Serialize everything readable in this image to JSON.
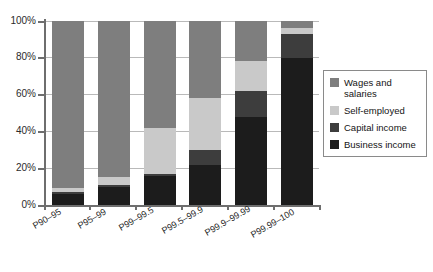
{
  "chart_data": {
    "type": "bar",
    "subtype": "stacked-100-percent",
    "title": "",
    "xlabel": "",
    "ylabel": "",
    "ylim": [
      0,
      100
    ],
    "ytick_labels": [
      "0%",
      "20%",
      "40%",
      "60%",
      "80%",
      "100%"
    ],
    "ytick_values": [
      0,
      20,
      40,
      60,
      80,
      100
    ],
    "grid": true,
    "legend_position": "right",
    "categories": [
      "P90–95",
      "P95–99",
      "P99–99.5",
      "P99.5–99.9",
      "P99.9–99.99",
      "P99.99–100"
    ],
    "series": [
      {
        "name": "Business income",
        "color": "#1c1c1c",
        "values": [
          6,
          10,
          16,
          22,
          48,
          80
        ]
      },
      {
        "name": "Capital income",
        "color": "#3d3d3d",
        "values": [
          1,
          1,
          1,
          8,
          14,
          13
        ]
      },
      {
        "name": "Self-employed",
        "color": "#c9c9c9",
        "values": [
          2,
          4,
          25,
          28,
          16,
          3
        ]
      },
      {
        "name": "Wages and salaries",
        "color": "#7e7e7e",
        "values": [
          91,
          85,
          58,
          42,
          22,
          4
        ]
      }
    ]
  },
  "legend": {
    "items": [
      {
        "label": "Wages and salaries",
        "color": "#7e7e7e",
        "key": "wages-and-salaries"
      },
      {
        "label": "Self-employed",
        "color": "#c9c9c9",
        "key": "self-employed"
      },
      {
        "label": "Capital income",
        "color": "#3d3d3d",
        "key": "capital-income"
      },
      {
        "label": "Business income",
        "color": "#1c1c1c",
        "key": "business-income"
      }
    ]
  },
  "axes": {
    "y": {
      "ticks": [
        {
          "label": "100%",
          "value": 100
        },
        {
          "label": "80%",
          "value": 80
        },
        {
          "label": "60%",
          "value": 60
        },
        {
          "label": "40%",
          "value": 40
        },
        {
          "label": "20%",
          "value": 20
        },
        {
          "label": "0%",
          "value": 0
        }
      ]
    },
    "x": {
      "ticks": [
        {
          "label": "P90–95"
        },
        {
          "label": "P95–99"
        },
        {
          "label": "P99–99.5"
        },
        {
          "label": "P99.5–99.9"
        },
        {
          "label": "P99.9–99.99"
        },
        {
          "label": "P99.99–100"
        }
      ]
    }
  },
  "colors": {
    "axis": "#6e6e6e",
    "grid": "#b9b9b9",
    "text": "#1f1f1f",
    "background": "#ffffff",
    "legend_border": "#8a8a8a"
  }
}
